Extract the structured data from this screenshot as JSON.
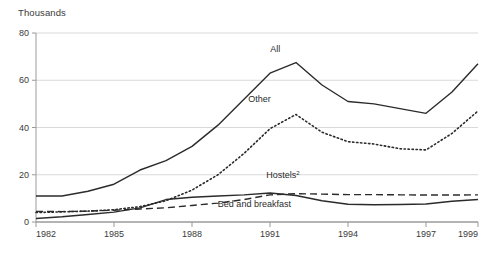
{
  "unit_label": "Thousands",
  "chart_data": {
    "type": "line",
    "title": "",
    "subtitle": "",
    "xlabel": "",
    "ylabel": "Thousands",
    "xlim": [
      1982,
      1999
    ],
    "ylim": [
      0,
      80
    ],
    "y_ticks": [
      0,
      20,
      40,
      60,
      80
    ],
    "y_tick_labels": [
      "0",
      "20",
      "40",
      "60",
      "80"
    ],
    "x_ticks": [
      1982,
      1985,
      1988,
      1991,
      1994,
      1997,
      1999
    ],
    "x_tick_labels": [
      "1982",
      "1985",
      "1988",
      "1991",
      "1994",
      "1997",
      "1999"
    ],
    "grid": "horizontal",
    "legend_position": "inline-annotations",
    "x": [
      1982,
      1983,
      1984,
      1985,
      1986,
      1987,
      1988,
      1989,
      1990,
      1991,
      1992,
      1993,
      1994,
      1995,
      1996,
      1997,
      1998,
      1999
    ],
    "series": [
      {
        "name": "All",
        "label": "All",
        "style": "solid",
        "color": "#2b2b2b",
        "label_x": 1991.2,
        "label_y": 72,
        "values": [
          11,
          11,
          13,
          16,
          22,
          26,
          32,
          41,
          52,
          63,
          67.5,
          58,
          51,
          50,
          48,
          46,
          55,
          67
        ]
      },
      {
        "name": "Other",
        "label": "Other",
        "style": "dotted",
        "color": "#2b2b2b",
        "label_x": 1990.6,
        "label_y": 51,
        "values": [
          4,
          4.3,
          4.6,
          5.2,
          6.5,
          9,
          13.5,
          20,
          29,
          39.5,
          45.5,
          38,
          34,
          33,
          31,
          30.5,
          37.5,
          47
        ]
      },
      {
        "name": "Hostels2",
        "label": "Hostels",
        "label_superscript": "2",
        "style": "dashed",
        "color": "#2b2b2b",
        "label_x": 1991.5,
        "label_y": 18.5,
        "values": [
          4.5,
          4.4,
          4.6,
          5,
          5.5,
          6,
          7,
          8,
          9.5,
          11.5,
          12,
          11.8,
          11.6,
          11.6,
          11.5,
          11.4,
          11.4,
          11.5
        ]
      },
      {
        "name": "Bed and breakfast",
        "label": "Bed and breakfast",
        "style": "solid",
        "color": "#2b2b2b",
        "label_x": 1990.4,
        "label_y": 6.5,
        "values": [
          1.5,
          2.2,
          3.2,
          4.2,
          6,
          9.5,
          10.5,
          11,
          11.5,
          12.3,
          11.2,
          9,
          7.5,
          7.3,
          7.4,
          7.6,
          8.8,
          9.5
        ]
      }
    ]
  },
  "colors": {
    "ink": "#2b2b2b",
    "axis": "#9a9a9a",
    "grid": "#d9d9d9",
    "background": "#ffffff"
  }
}
